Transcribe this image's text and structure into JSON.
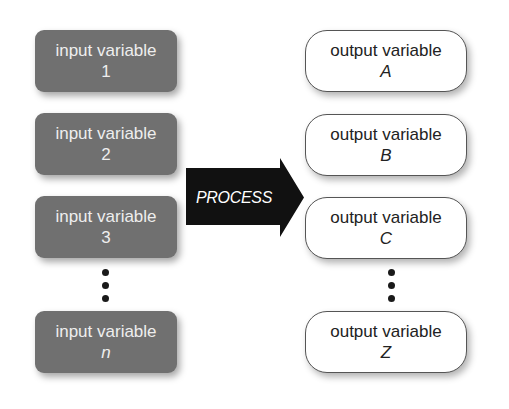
{
  "inputs": [
    {
      "label": "input variable",
      "id": "1",
      "italic": false
    },
    {
      "label": "input variable",
      "id": "2",
      "italic": false
    },
    {
      "label": "input variable",
      "id": "3",
      "italic": false
    },
    {
      "label": "input variable",
      "id": "n",
      "italic": true
    }
  ],
  "process": {
    "label": "PROCESS"
  },
  "outputs": [
    {
      "label": "output variable",
      "id": "A"
    },
    {
      "label": "output variable",
      "id": "B"
    },
    {
      "label": "output variable",
      "id": "C"
    },
    {
      "label": "output variable",
      "id": "Z"
    }
  ],
  "colors": {
    "input_fill": "#707070",
    "input_text": "#eeeeee",
    "output_fill": "#ffffff",
    "output_text": "#222222",
    "arrow_fill": "#111111",
    "arrow_text": "#ffffff"
  }
}
